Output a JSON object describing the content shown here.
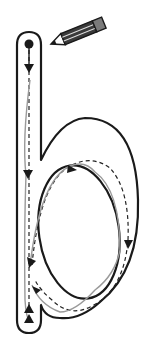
{
  "figure": {
    "letter": "b",
    "colors": {
      "outline": "#1a1a1a",
      "guide_dash": "#222222",
      "trace": "#9a9a9a",
      "background": "#ffffff",
      "pencil_body": "#3a3a3a",
      "pencil_eraser": "#7a7a7a"
    },
    "icons": [
      "pencil-icon",
      "start-dot-icon",
      "arrow-down-icon",
      "arrow-up-icon"
    ]
  }
}
